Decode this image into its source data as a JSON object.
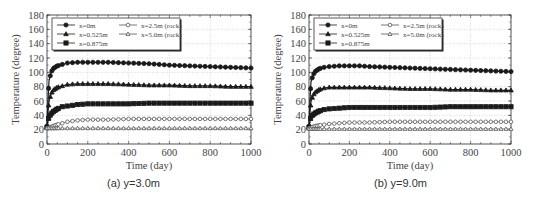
{
  "chart_data": [
    {
      "type": "line",
      "caption": "(a) y=3.0m",
      "xlabel": "Time (day)",
      "ylabel": "Temperature (degree)",
      "xlim": [
        0,
        1000
      ],
      "ylim": [
        0,
        180
      ],
      "xticks": [
        0,
        200,
        400,
        600,
        800,
        1000
      ],
      "yticks": [
        0,
        20,
        40,
        60,
        80,
        100,
        120,
        140,
        160,
        180
      ],
      "grid": true,
      "legend_position": "upper-left",
      "x": [
        0,
        5,
        10,
        20,
        30,
        50,
        75,
        100,
        150,
        200,
        250,
        300,
        400,
        500,
        600,
        700,
        800,
        900,
        1000
      ],
      "series": [
        {
          "name": "x=0m",
          "marker": "circle-filled",
          "values": [
            25,
            62,
            88,
            100,
            105,
            109,
            111,
            113,
            114,
            114,
            114,
            114,
            113,
            112,
            110,
            109,
            108,
            107,
            106
          ]
        },
        {
          "name": "x=0.525m",
          "marker": "triangle-filled",
          "values": [
            24,
            45,
            60,
            70,
            75,
            79,
            81,
            83,
            84,
            84,
            84,
            84,
            83,
            82,
            82,
            81,
            81,
            80,
            80
          ]
        },
        {
          "name": "x=0.875m",
          "marker": "square-filled",
          "values": [
            23,
            32,
            38,
            42,
            45,
            49,
            52,
            53,
            55,
            56,
            56,
            56,
            56,
            57,
            57,
            57,
            57,
            57,
            57
          ]
        },
        {
          "name": "x=2.5m (rock)",
          "marker": "circle-open",
          "values": [
            22,
            22,
            23,
            24,
            25,
            27,
            29,
            31,
            33,
            34,
            34,
            34,
            35,
            35,
            35,
            35,
            35,
            35,
            35
          ]
        },
        {
          "name": "x=5.0m (rock)",
          "marker": "triangle-open",
          "values": [
            22,
            22,
            22,
            22,
            22,
            22,
            22,
            22,
            22,
            22,
            22,
            22,
            22,
            22,
            22,
            22,
            22,
            22,
            22
          ]
        }
      ]
    },
    {
      "type": "line",
      "caption": "(b) y=9.0m",
      "xlabel": "Time (day)",
      "ylabel": "Temperature (degree)",
      "xlim": [
        0,
        1000
      ],
      "ylim": [
        0,
        180
      ],
      "xticks": [
        0,
        200,
        400,
        600,
        800,
        1000
      ],
      "yticks": [
        0,
        20,
        40,
        60,
        80,
        100,
        120,
        140,
        160,
        180
      ],
      "grid": true,
      "legend_position": "upper-left",
      "x": [
        0,
        5,
        10,
        20,
        30,
        50,
        75,
        100,
        150,
        200,
        250,
        300,
        400,
        500,
        600,
        700,
        800,
        900,
        1000
      ],
      "series": [
        {
          "name": "x=0m",
          "marker": "circle-filled",
          "values": [
            25,
            62,
            87,
            96,
            101,
            105,
            107,
            108,
            109,
            109,
            109,
            108,
            107,
            106,
            105,
            104,
            103,
            102,
            101
          ]
        },
        {
          "name": "x=0.525m",
          "marker": "triangle-filled",
          "values": [
            24,
            45,
            60,
            68,
            72,
            76,
            78,
            79,
            79,
            79,
            79,
            79,
            78,
            77,
            77,
            76,
            76,
            75,
            75
          ]
        },
        {
          "name": "x=0.875m",
          "marker": "square-filled",
          "values": [
            23,
            32,
            38,
            41,
            43,
            46,
            48,
            49,
            50,
            51,
            51,
            51,
            51,
            51,
            51,
            52,
            52,
            52,
            52
          ]
        },
        {
          "name": "x=2.5m (rock)",
          "marker": "circle-open",
          "values": [
            22,
            22,
            23,
            24,
            25,
            26,
            27,
            28,
            29,
            30,
            30,
            30,
            31,
            31,
            31,
            31,
            31,
            31,
            31
          ]
        },
        {
          "name": "x=5.0m (rock)",
          "marker": "triangle-open",
          "values": [
            21,
            21,
            21,
            21,
            21,
            21,
            21,
            21,
            21,
            21,
            21,
            21,
            21,
            21,
            21,
            21,
            21,
            21,
            21
          ]
        }
      ]
    }
  ],
  "panels": [
    {
      "caption": "(a) y=3.0m",
      "frame": {
        "left": 47,
        "top": 15,
        "right": 251,
        "bottom": 144
      }
    },
    {
      "caption": "(b) y=9.0m",
      "frame": {
        "left": 42,
        "top": 15,
        "right": 244,
        "bottom": 144
      }
    }
  ],
  "colors": {
    "line": "#1a1a1a",
    "open_marker": "#555555",
    "grid": "#b0b0b0",
    "axis": "#333333",
    "text": "#444444"
  }
}
